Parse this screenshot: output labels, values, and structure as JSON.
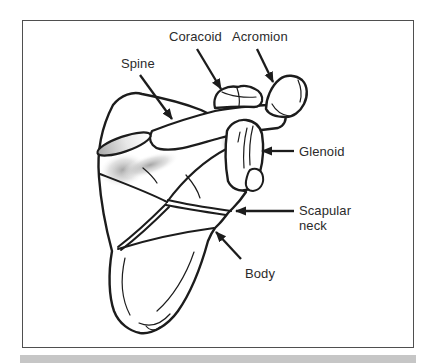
{
  "figure": {
    "labels": {
      "spine": "Spine",
      "coracoid": "Coracoid",
      "acromion": "Acromion",
      "glenoid": "Glenoid",
      "scapular_neck": "Scapular neck",
      "body": "Body"
    },
    "colors": {
      "line": "#1c1c1c",
      "label_text": "#2b2b2b",
      "frame_border": "#4f4f4f",
      "caption_bar": "#c6c6c6",
      "shading": "#9a9a9a",
      "background": "#ffffff"
    }
  }
}
